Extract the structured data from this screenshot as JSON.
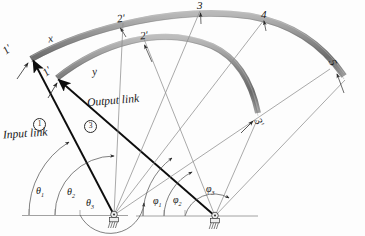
{
  "figure": {
    "colors": {
      "coupler_link": "#8a8a8a",
      "coupler_link_dark": "#6f6f6f",
      "coupler_link_light": "#b4b4b4",
      "heavy_line": "#101010",
      "thin_line": "#8d8d8d",
      "ground_line": "#777777",
      "text": "#161616"
    }
  },
  "labels": {
    "input_link": "Input link",
    "output_link": "Output link",
    "curve_x": "x",
    "curve_y": "y",
    "link_number_input": "1",
    "link_number_output": "3",
    "positions_outer": [
      "1",
      "2",
      "3",
      "4",
      "5"
    ],
    "positions_inner": [
      "1",
      "2",
      "3"
    ],
    "prime_mark": "'"
  },
  "position_markers": {
    "outer_arc": [
      {
        "id": "p1",
        "text": "1",
        "prime": true,
        "x": 4,
        "y": 50
      },
      {
        "id": "p2",
        "text": "2",
        "prime": true,
        "x": 121,
        "y": 20
      },
      {
        "id": "p3",
        "text": "3",
        "prime": false,
        "x": 199,
        "y": 4
      },
      {
        "id": "p4",
        "text": "4",
        "prime": false,
        "x": 262,
        "y": 14
      },
      {
        "id": "p5",
        "text": "5",
        "prime": false,
        "x": 331,
        "y": 62
      }
    ],
    "inner_arc": [
      {
        "id": "q1",
        "text": "1",
        "prime": true,
        "x": 44,
        "y": 72
      },
      {
        "id": "q2",
        "text": "2",
        "prime": true,
        "x": 142,
        "y": 36
      },
      {
        "id": "q3",
        "text": "3",
        "prime": true,
        "x": 256,
        "y": 123
      }
    ]
  },
  "angles": {
    "input": [
      {
        "name": "theta1",
        "glyph": "θ",
        "sub": "1",
        "x": 38,
        "y": 193,
        "value_deg": 118
      },
      {
        "name": "theta2",
        "glyph": "θ",
        "sub": "2",
        "x": 69,
        "y": 194,
        "value_deg": 103
      },
      {
        "name": "theta3",
        "glyph": "θ",
        "sub": "3",
        "x": 88,
        "y": 205,
        "value_deg": 86
      }
    ],
    "output": [
      {
        "name": "phi1",
        "glyph": "φ",
        "sub": "1",
        "x": 155,
        "y": 203,
        "value_deg": 122
      },
      {
        "name": "phi2",
        "glyph": "φ",
        "sub": "2",
        "x": 175,
        "y": 202,
        "value_deg": 106
      },
      {
        "name": "phi3",
        "glyph": "φ",
        "sub": "3",
        "x": 208,
        "y": 191,
        "value_deg": 63
      }
    ]
  },
  "pivots": {
    "input_pivot": {
      "name": "ground-pivot-A",
      "x": 114,
      "y": 215
    },
    "output_pivot": {
      "name": "ground-pivot-B",
      "x": 215,
      "y": 216
    }
  },
  "circled_numbers": [
    {
      "name": "input-link-number",
      "text": "1",
      "x": 33,
      "y": 126
    },
    {
      "name": "output-link-number",
      "text": "3",
      "x": 84,
      "y": 128
    }
  ]
}
